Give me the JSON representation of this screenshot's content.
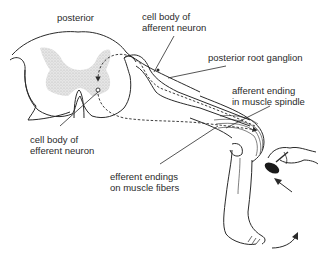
{
  "labels": {
    "posterior": "posterior",
    "cell_body_afferent_line1": "cell body of",
    "cell_body_afferent_line2": "afferent neuron",
    "posterior_root_ganglion": "posterior root ganglion",
    "afferent_ending_line1": "afferent ending",
    "afferent_ending_line2": "in muscle spindle",
    "cell_body_efferent_line1": "cell body of",
    "cell_body_efferent_line2": "efferent neuron",
    "efferent_endings_line1": "efferent endings",
    "efferent_endings_line2": "on muscle fibers"
  },
  "colors": {
    "ink": "#2a2a2a",
    "gray_matter": "#d6d6d6",
    "background": "#ffffff"
  }
}
